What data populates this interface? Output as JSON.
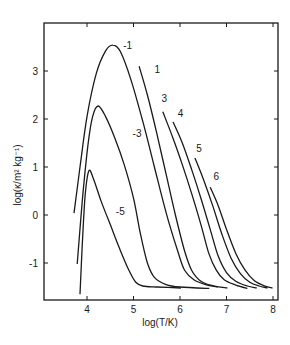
{
  "chart_data": {
    "type": "line",
    "title": "",
    "xlabel": "log(T/K)",
    "ylabel": "log(κ/m² kg⁻¹)",
    "xlim": [
      3.08,
      8.13
    ],
    "ylim": [
      -1.9,
      3.98
    ],
    "grid": false,
    "legend": "inline curve labels",
    "x_ticks": [
      4,
      5,
      6,
      7,
      8
    ],
    "y_ticks": [
      -1,
      0,
      1,
      2,
      3
    ],
    "series": [
      {
        "name": "-1",
        "label_pos": [
          4.78,
          3.45
        ],
        "points": [
          [
            3.72,
            0.04
          ],
          [
            3.85,
            1.0
          ],
          [
            4.0,
            2.05
          ],
          [
            4.2,
            2.95
          ],
          [
            4.4,
            3.42
          ],
          [
            4.56,
            3.54
          ],
          [
            4.72,
            3.4
          ],
          [
            4.95,
            2.8
          ],
          [
            5.2,
            1.95
          ],
          [
            5.45,
            1.0
          ],
          [
            5.7,
            0.05
          ],
          [
            5.95,
            -0.75
          ],
          [
            6.1,
            -1.15
          ],
          [
            6.3,
            -1.35
          ],
          [
            6.55,
            -1.45
          ],
          [
            6.81,
            -1.5
          ]
        ]
      },
      {
        "name": "-3",
        "label_pos": [
          4.98,
          1.62
        ],
        "points": [
          [
            3.79,
            -1.02
          ],
          [
            3.9,
            0.3
          ],
          [
            4.02,
            1.45
          ],
          [
            4.12,
            2.05
          ],
          [
            4.24,
            2.27
          ],
          [
            4.4,
            2.05
          ],
          [
            4.6,
            1.6
          ],
          [
            4.8,
            1.05
          ],
          [
            5.0,
            0.35
          ],
          [
            5.15,
            -0.4
          ],
          [
            5.3,
            -1.0
          ],
          [
            5.45,
            -1.3
          ],
          [
            5.7,
            -1.45
          ],
          [
            6.0,
            -1.5
          ],
          [
            6.63,
            -1.53
          ]
        ]
      },
      {
        "name": "-5",
        "label_pos": [
          4.62,
          0.0
        ],
        "points": [
          [
            3.85,
            -1.65
          ],
          [
            3.9,
            -0.6
          ],
          [
            3.96,
            0.4
          ],
          [
            4.04,
            0.92
          ],
          [
            4.14,
            0.75
          ],
          [
            4.3,
            0.3
          ],
          [
            4.5,
            -0.2
          ],
          [
            4.7,
            -0.7
          ],
          [
            4.9,
            -1.15
          ],
          [
            5.05,
            -1.4
          ],
          [
            5.2,
            -1.48
          ],
          [
            5.5,
            -1.5
          ],
          [
            6.02,
            -1.52
          ]
        ]
      },
      {
        "name": "1",
        "label_pos": [
          5.45,
          2.95
        ],
        "points": [
          [
            5.12,
            3.1
          ],
          [
            5.3,
            2.5
          ],
          [
            5.5,
            1.7
          ],
          [
            5.7,
            0.85
          ],
          [
            5.9,
            0.0
          ],
          [
            6.1,
            -0.75
          ],
          [
            6.25,
            -1.15
          ],
          [
            6.45,
            -1.38
          ],
          [
            6.7,
            -1.47
          ],
          [
            7.02,
            -1.52
          ]
        ]
      },
      {
        "name": "3",
        "label_pos": [
          5.6,
          2.35
        ],
        "points": [
          [
            5.63,
            2.15
          ],
          [
            5.85,
            1.6
          ],
          [
            6.05,
            1.05
          ],
          [
            6.25,
            0.45
          ],
          [
            6.45,
            -0.2
          ],
          [
            6.62,
            -0.8
          ],
          [
            6.78,
            -1.15
          ],
          [
            6.95,
            -1.35
          ],
          [
            7.2,
            -1.46
          ],
          [
            7.45,
            -1.53
          ]
        ]
      },
      {
        "name": "4",
        "label_pos": [
          5.95,
          2.05
        ],
        "points": [
          [
            5.85,
            1.94
          ],
          [
            6.05,
            1.5
          ],
          [
            6.25,
            0.95
          ],
          [
            6.45,
            0.35
          ],
          [
            6.65,
            -0.3
          ],
          [
            6.82,
            -0.85
          ],
          [
            7.0,
            -1.2
          ],
          [
            7.2,
            -1.38
          ],
          [
            7.45,
            -1.48
          ],
          [
            7.65,
            -1.52
          ]
        ]
      },
      {
        "name": "5",
        "label_pos": [
          6.35,
          1.32
        ],
        "points": [
          [
            6.32,
            1.19
          ],
          [
            6.5,
            0.75
          ],
          [
            6.7,
            0.2
          ],
          [
            6.9,
            -0.4
          ],
          [
            7.1,
            -0.9
          ],
          [
            7.3,
            -1.22
          ],
          [
            7.5,
            -1.4
          ],
          [
            7.7,
            -1.48
          ],
          [
            7.88,
            -1.52
          ]
        ]
      },
      {
        "name": "6",
        "label_pos": [
          6.72,
          0.72
        ],
        "points": [
          [
            6.65,
            0.58
          ],
          [
            6.82,
            0.2
          ],
          [
            7.0,
            -0.3
          ],
          [
            7.2,
            -0.8
          ],
          [
            7.4,
            -1.15
          ],
          [
            7.6,
            -1.37
          ],
          [
            7.8,
            -1.47
          ],
          [
            7.99,
            -1.52
          ]
        ]
      }
    ]
  },
  "layout": {
    "frame": {
      "left": 44,
      "top": 23,
      "right": 278,
      "bottom": 300
    },
    "x_origin_value": 4,
    "x_origin_px": 87,
    "x_px_per_unit": 46.5,
    "y_origin_value": 3,
    "y_origin_px": 71,
    "y_px_per_unit": 48,
    "line_color": "#1a1a1a"
  }
}
